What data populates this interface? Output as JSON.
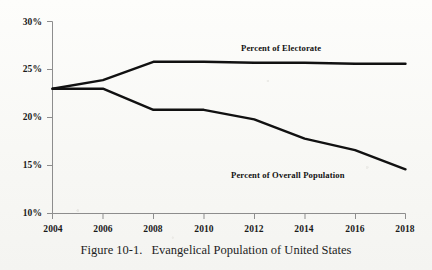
{
  "caption": {
    "number": "Figure 10-1.",
    "title": "Evangelical Population of United States"
  },
  "chart_data": {
    "type": "line",
    "title": "Evangelical Population of United States",
    "xlabel": "",
    "ylabel": "",
    "x": [
      2004,
      2006,
      2008,
      2010,
      2012,
      2014,
      2016,
      2018
    ],
    "xtick_labels": [
      "2004",
      "2006",
      "2008",
      "2010",
      "2012",
      "2014",
      "2016",
      "2018"
    ],
    "ytick_labels": [
      "30%",
      "25%",
      "20%",
      "15%",
      "10%"
    ],
    "ytick_values": [
      30,
      25,
      20,
      15,
      10
    ],
    "xlim": [
      2004,
      2018
    ],
    "ylim": [
      10,
      30
    ],
    "grid": false,
    "legend": "inline-labels",
    "series": [
      {
        "name": "Percent of Electorate",
        "values": [
          23.0,
          23.9,
          25.8,
          25.8,
          25.7,
          25.7,
          25.6,
          25.6
        ],
        "label_x": 2012.0,
        "label_y": 27.4,
        "color": "#111111"
      },
      {
        "name": "Percent of Overall Population",
        "values": [
          23.0,
          23.0,
          20.8,
          20.8,
          19.8,
          17.8,
          16.6,
          14.6
        ],
        "label_x": 2012.1,
        "label_y": 15.9,
        "color": "#111111"
      }
    ],
    "axis_color": "#8d8d8d",
    "line_color": "#111111"
  }
}
